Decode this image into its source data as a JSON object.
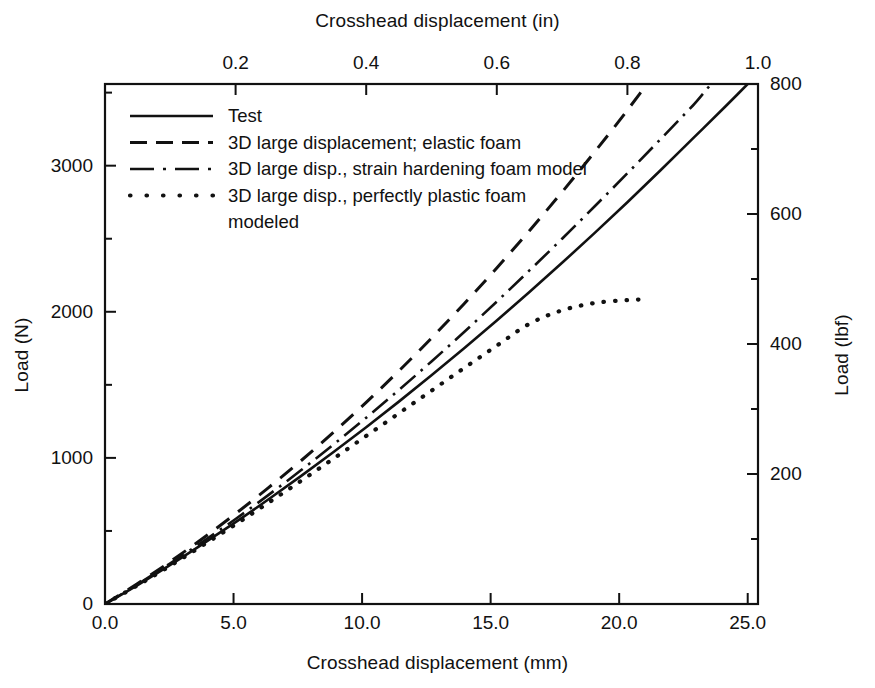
{
  "chart_data": {
    "type": "line",
    "title": "",
    "xlabel": "Crosshead displacement (mm)",
    "ylabel": "Load (N)",
    "x2label": "Crosshead displacement (in)",
    "y2label": "Load (lbf)",
    "xlim": [
      0,
      25.4
    ],
    "ylim": [
      0,
      3559
    ],
    "x2lim": [
      0,
      1.0
    ],
    "y2lim": [
      0,
      800
    ],
    "grid": false,
    "legend_position": "upper left (inside axes)",
    "xticks": [
      "0.0",
      "5.0",
      "10.0",
      "15.0",
      "20.0",
      "25.0"
    ],
    "xtick_values": [
      0,
      5,
      10,
      15,
      20,
      25
    ],
    "x2ticks": [
      "0.2",
      "0.4",
      "0.6",
      "0.8",
      "1.0"
    ],
    "x2tick_values": [
      0.2,
      0.4,
      0.6,
      0.8,
      1.0
    ],
    "yticks": [
      "0",
      "1000",
      "2000",
      "3000"
    ],
    "ytick_values": [
      0,
      1000,
      2000,
      3000
    ],
    "yminor_values": [
      500,
      1500,
      2500,
      3500
    ],
    "y2ticks": [
      "200",
      "400",
      "600",
      "800"
    ],
    "y2tick_values": [
      200,
      400,
      600,
      800
    ],
    "y2minor_values": [
      100,
      300,
      500,
      700
    ],
    "series": [
      {
        "name": "Test",
        "style": "solid",
        "x": [
          0.0,
          1.27,
          2.54,
          3.81,
          5.08,
          6.35,
          7.62,
          8.89,
          10.16,
          11.43,
          12.7,
          13.97,
          15.24,
          16.51,
          17.78,
          19.05,
          20.32,
          21.59,
          22.86,
          24.13,
          25.4
        ],
        "y": [
          0,
          130,
          268,
          412,
          560,
          715,
          875,
          1040,
          1210,
          1385,
          1565,
          1750,
          1940,
          2135,
          2335,
          2540,
          2750,
          2965,
          3185,
          3405,
          3630
        ]
      },
      {
        "name": "3D large displacement; elastic foam",
        "style": "dashed",
        "x": [
          0.0,
          1.27,
          2.54,
          3.81,
          5.08,
          6.35,
          7.62,
          8.89,
          10.16,
          11.43,
          12.7,
          13.97,
          15.24,
          16.51,
          17.78,
          19.05,
          20.32,
          21.59
        ],
        "y": [
          0,
          140,
          290,
          450,
          618,
          795,
          980,
          1175,
          1380,
          1595,
          1820,
          2055,
          2300,
          2555,
          2820,
          3095,
          3380,
          3680
        ]
      },
      {
        "name": "3D large disp., strain hardening foam model",
        "style": "dashdot",
        "x": [
          0.0,
          1.27,
          2.54,
          3.81,
          5.08,
          6.35,
          7.62,
          8.89,
          10.16,
          11.43,
          12.7,
          13.97,
          15.24,
          16.51,
          17.78,
          19.05,
          20.32,
          21.59,
          22.86,
          24.13,
          25.4
        ],
        "y": [
          0,
          135,
          278,
          428,
          582,
          745,
          915,
          1092,
          1275,
          1465,
          1660,
          1862,
          2070,
          2283,
          2500,
          2722,
          2948,
          3178,
          3410,
          3645,
          3650
        ]
      },
      {
        "name": "3D large disp., perfectly plastic foam modeled",
        "style": "dotted",
        "x": [
          0.0,
          1.27,
          2.54,
          3.81,
          5.08,
          6.35,
          7.62,
          8.89,
          10.16,
          11.43,
          12.7,
          13.97,
          15.24,
          16.51,
          17.78,
          19.05,
          20.32,
          21.0
        ],
        "y": [
          0,
          128,
          262,
          402,
          545,
          692,
          842,
          995,
          1150,
          1305,
          1460,
          1615,
          1768,
          1918,
          2010,
          2060,
          2080,
          2085
        ]
      }
    ],
    "legend_entries": [
      {
        "label": "Test",
        "style": "solid"
      },
      {
        "label": "3D large displacement; elastic foam",
        "style": "dashed"
      },
      {
        "label": "3D large disp., strain hardening foam model",
        "style": "dashdot"
      },
      {
        "label": "3D large disp., perfectly plastic foam",
        "style": "dotted"
      },
      {
        "label": "modeled",
        "style": "none"
      }
    ],
    "line_color": "#111111",
    "background_color": "#ffffff"
  }
}
